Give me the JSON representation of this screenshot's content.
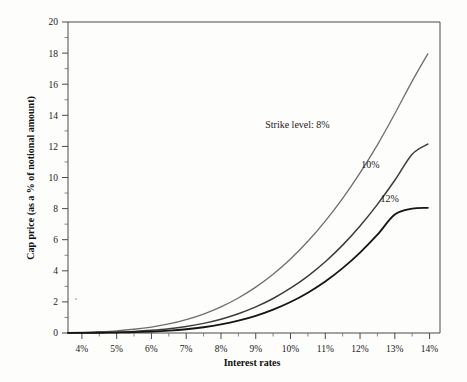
{
  "chart_data": {
    "type": "line",
    "title": "",
    "xlabel": "Interest rates",
    "ylabel": "Cap price (as a % of notional amount)",
    "xlim": [
      3.6,
      14.3
    ],
    "ylim": [
      0,
      20
    ],
    "grid": false,
    "legend_position": "inline-annotations",
    "x_tick_labels": [
      "4%",
      "5%",
      "6%",
      "7%",
      "8%",
      "9%",
      "10%",
      "11%",
      "12%",
      "13%",
      "14%"
    ],
    "x_tick_values": [
      4,
      5,
      6,
      7,
      8,
      9,
      10,
      11,
      12,
      13,
      14
    ],
    "y_tick_labels": [
      "0",
      "2",
      "4",
      "6",
      "8",
      "10",
      "12",
      "14",
      "16",
      "18",
      "20"
    ],
    "y_tick_values": [
      0,
      2,
      4,
      6,
      8,
      10,
      12,
      14,
      16,
      18,
      20
    ],
    "x": [
      3.6,
      4,
      4.5,
      5,
      5.5,
      6,
      6.5,
      7,
      7.5,
      8,
      8.5,
      9,
      9.5,
      10,
      10.5,
      11,
      11.5,
      12,
      12.5,
      13,
      13.5,
      13.95
    ],
    "series": [
      {
        "name": "Strike level: 8%",
        "annotation": "Strike level: 8%",
        "color": "#6e6e6e",
        "width": 1.3,
        "values": [
          0.02,
          0.04,
          0.08,
          0.14,
          0.24,
          0.38,
          0.58,
          0.86,
          1.22,
          1.68,
          2.25,
          2.95,
          3.78,
          4.76,
          5.9,
          7.2,
          8.66,
          10.3,
          12.1,
          14.1,
          16.2,
          17.95
        ]
      },
      {
        "name": "10%",
        "annotation": "10%",
        "color": "#3c3c3c",
        "width": 1.5,
        "values": [
          0.01,
          0.02,
          0.03,
          0.06,
          0.1,
          0.17,
          0.27,
          0.42,
          0.62,
          0.89,
          1.24,
          1.68,
          2.22,
          2.88,
          3.66,
          4.58,
          5.65,
          6.88,
          8.27,
          9.82,
          11.5,
          12.15
        ]
      },
      {
        "name": "12%",
        "annotation": "12%",
        "color": "#151515",
        "width": 1.8,
        "values": [
          0.005,
          0.01,
          0.015,
          0.03,
          0.05,
          0.09,
          0.15,
          0.24,
          0.37,
          0.55,
          0.79,
          1.1,
          1.5,
          1.99,
          2.59,
          3.31,
          4.17,
          5.17,
          6.32,
          7.62,
          8.0,
          8.05
        ]
      }
    ],
    "annotations": [
      {
        "text": "Strike level: 8%",
        "x": 10.2,
        "y": 13.2
      },
      {
        "text": "10%",
        "x": 12.3,
        "y": 10.6
      },
      {
        "text": "12%",
        "x": 12.85,
        "y": 8.45
      }
    ]
  },
  "axes": {
    "x_title": "Interest rates",
    "y_title": "Cap price (as a % of notional amount)"
  }
}
